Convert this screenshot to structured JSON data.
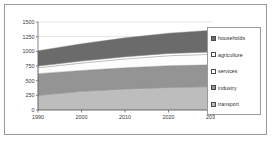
{
  "frame": {
    "name": "chart-frame"
  },
  "legend": {
    "position": "right",
    "items": [
      {
        "label": "households",
        "color": "#6b6b6b"
      },
      {
        "label": "agriculture",
        "color": "#ffffff"
      },
      {
        "label": "services",
        "color": "#fdfdfd"
      },
      {
        "label": "industry",
        "color": "#949494"
      },
      {
        "label": "transport",
        "color": "#bdbdbd"
      }
    ]
  },
  "chart_data": {
    "type": "area",
    "stacked": true,
    "title": "",
    "subtitle": "",
    "xlabel": "",
    "ylabel": "mtoe",
    "x": [
      1990,
      2000,
      2010,
      2020,
      2030
    ],
    "xtick_labels": [
      "1990",
      "2000",
      "2010",
      "2020",
      "2030"
    ],
    "xlim": [
      1990,
      2030
    ],
    "ylim": [
      0,
      1500
    ],
    "ytick_labels": [
      "0",
      "250",
      "500",
      "750",
      "1000",
      "1250",
      "1500"
    ],
    "yticks": [
      0,
      250,
      500,
      750,
      1000,
      1250,
      1500
    ],
    "grid": true,
    "grid_axis": "y",
    "legend_position": "right",
    "stack_order_bottom_to_top": [
      "transport",
      "industry",
      "services",
      "agriculture",
      "households"
    ],
    "series": [
      {
        "name": "transport",
        "color": "#bdbdbd",
        "values": [
          250,
          320,
          360,
          385,
          400
        ]
      },
      {
        "name": "industry",
        "color": "#949494",
        "values": [
          370,
          355,
          360,
          370,
          370
        ]
      },
      {
        "name": "services",
        "color": "#fdfdfd",
        "values": [
          100,
          125,
          150,
          170,
          180
        ]
      },
      {
        "name": "agriculture",
        "color": "#ffffff",
        "values": [
          30,
          35,
          38,
          40,
          40
        ]
      },
      {
        "name": "households",
        "color": "#6b6b6b",
        "values": [
          260,
          295,
          322,
          345,
          370
        ]
      }
    ],
    "cumulative_tops": {
      "transport": [
        250,
        320,
        360,
        385,
        400
      ],
      "industry": [
        620,
        675,
        720,
        755,
        770
      ],
      "services": [
        720,
        800,
        870,
        925,
        950
      ],
      "agriculture": [
        750,
        835,
        908,
        965,
        990
      ],
      "households": [
        1010,
        1130,
        1230,
        1310,
        1360
      ]
    },
    "total": [
      1010,
      1130,
      1230,
      1310,
      1360
    ]
  },
  "colors": {
    "frame_border": "#9a9a9a",
    "axis": "#555555",
    "grid": "#c9c9c9",
    "text": "#3b3b3b",
    "plot_background": "#ffffff"
  }
}
